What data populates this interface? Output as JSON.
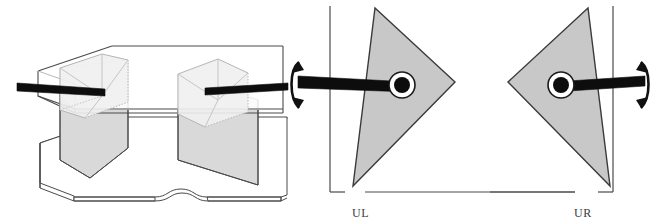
{
  "figure": {
    "width": 657,
    "height": 224,
    "background": "#ffffff"
  },
  "colors": {
    "outline": "#3a3a3a",
    "outline_light": "#8a8a8a",
    "triangle_fill": "#c8c8c8",
    "prism_face_light": "#ececec",
    "prism_face_mid": "#d9d9d9",
    "plate_fill": "#ffffff",
    "axle_black": "#0d0d0d",
    "hub_white": "#ffffff",
    "arrow_black": "#111111",
    "label_text": "#3a3a3a"
  },
  "panels": [
    {
      "id": "isometric-assembly",
      "name": "isometric-assembly-view",
      "label": "",
      "description": "Exploded isometric view: upper plate, two triangular prisms, lower plate with central notch, two horizontal axles"
    },
    {
      "id": "section-ul",
      "name": "section-view-ul",
      "label": "UL",
      "description": "Cross-section of upper-left cam: triangle pointing right on axle entering from the left, double-headed rotation arrow on the left",
      "triangle_orientation": "apex-right",
      "axle_side": "left",
      "rotation_arrow_side": "left"
    },
    {
      "id": "section-ur",
      "name": "section-view-ur",
      "label": "UR",
      "description": "Cross-section of upper-right cam: triangle pointing left on axle entering from the right, double-headed rotation arrow on the right",
      "triangle_orientation": "apex-left",
      "axle_side": "right",
      "rotation_arrow_side": "right"
    }
  ],
  "labels": {
    "ul": "UL",
    "ur": "UR"
  },
  "icons": {
    "rotation_arrow": "double-headed-curved-rotation-arrow",
    "axle": "axle-rod",
    "hub": "pivot-hub-ring"
  }
}
